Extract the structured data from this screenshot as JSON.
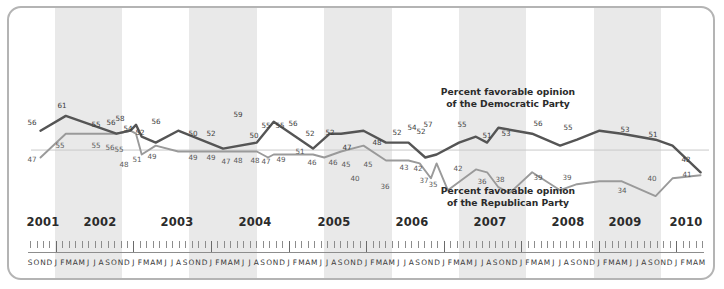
{
  "chart_data": {
    "type": "line",
    "title": "",
    "xlabel": "",
    "ylabel": "",
    "ylim": [
      30,
      65
    ],
    "grid": false,
    "legend_position": "inline-annotations",
    "annotations": [
      {
        "id": "dem",
        "text_line1": "Percent favorable opinion",
        "text_line2": "of the Democratic Party"
      },
      {
        "id": "rep",
        "text_line1": "Percent favorable opinion",
        "text_line2": "of the Republican Party"
      }
    ],
    "years": [
      "2001",
      "2002",
      "2003",
      "2004",
      "2005",
      "2006",
      "2007",
      "2008",
      "2009",
      "2010"
    ],
    "months_axis": [
      "S",
      "O",
      "N",
      "D",
      "J",
      "F",
      "M",
      "A",
      "M",
      "J",
      "J",
      "A",
      "S",
      "O",
      "N",
      "D",
      "J",
      "F",
      "M",
      "A",
      "M",
      "J",
      "J",
      "A",
      "S",
      "O",
      "N",
      "D",
      "J",
      "F",
      "M",
      "A",
      "M",
      "J",
      "J",
      "A",
      "S",
      "O",
      "N",
      "D",
      "J",
      "F",
      "M",
      "A",
      "M",
      "J",
      "J",
      "A",
      "S",
      "O",
      "N",
      "D",
      "J",
      "F",
      "M",
      "A",
      "M",
      "J",
      "J",
      "A",
      "S",
      "O",
      "N",
      "D",
      "J",
      "F",
      "M",
      "A",
      "M",
      "J",
      "J",
      "A",
      "S",
      "O",
      "N",
      "D",
      "J",
      "F",
      "M",
      "A",
      "M",
      "J",
      "J",
      "A",
      "S",
      "O",
      "N",
      "D",
      "J",
      "F",
      "M",
      "A",
      "M",
      "J",
      "J",
      "A",
      "S",
      "O",
      "N",
      "D",
      "J",
      "F",
      "M",
      "A",
      "M"
    ],
    "series": [
      {
        "name": "Percent favorable opinion of the Democratic Party",
        "color": "#555555",
        "points": [
          {
            "t": 0.5,
            "v": 56,
            "label": "56",
            "lx": 32,
            "ly": 118
          },
          {
            "t": 5.0,
            "v": 61,
            "label": "61",
            "lx": 62,
            "ly": 101
          },
          {
            "t": 14.0,
            "v": 55,
            "label": "55",
            "lx": 96,
            "ly": 120
          },
          {
            "t": 16.5,
            "v": 56,
            "label": "56",
            "lx": 111,
            "ly": 118
          },
          {
            "t": 17.5,
            "v": 58,
            "label": "58",
            "lx": 120,
            "ly": 114
          },
          {
            "t": 18.5,
            "v": 54,
            "label": "54",
            "lx": 128,
            "ly": 124
          },
          {
            "t": 21.0,
            "v": 52,
            "label": "52",
            "lx": 140,
            "ly": 128
          },
          {
            "t": 25.0,
            "v": 56,
            "label": "56",
            "lx": 156,
            "ly": 117
          },
          {
            "t": 33.0,
            "v": 50,
            "label": "50",
            "lx": 193,
            "ly": 129
          },
          {
            "t": 39.0,
            "v": 52,
            "label": "52",
            "lx": 211,
            "ly": 129
          },
          {
            "t": 42.0,
            "v": 59,
            "label": "59",
            "lx": 238,
            "ly": 110
          },
          {
            "t": 49.0,
            "v": 50,
            "label": "50",
            "lx": 254,
            "ly": 131
          },
          {
            "t": 52.0,
            "v": 55,
            "label": "55",
            "lx": 266,
            "ly": 121
          },
          {
            "t": 54.0,
            "v": 55,
            "label": "55",
            "lx": 280,
            "ly": 121
          },
          {
            "t": 58.0,
            "v": 56,
            "label": "56",
            "lx": 293,
            "ly": 119
          },
          {
            "t": 62.0,
            "v": 52,
            "label": "52",
            "lx": 310,
            "ly": 129
          },
          {
            "t": 66.0,
            "v": 52,
            "label": "52",
            "lx": 330,
            "ly": 128
          },
          {
            "t": 69.0,
            "v": 47,
            "label": "47",
            "lx": 347,
            "ly": 143
          },
          {
            "t": 71.0,
            "v": 48,
            "label": "48",
            "lx": 377,
            "ly": 138
          },
          {
            "t": 75.0,
            "v": 52,
            "label": "52",
            "lx": 397,
            "ly": 128
          },
          {
            "t": 78.0,
            "v": 54,
            "label": "54",
            "lx": 412,
            "ly": 123
          },
          {
            "t": 80.0,
            "v": 52,
            "label": "52",
            "lx": 421,
            "ly": 127
          },
          {
            "t": 82.0,
            "v": 57,
            "label": "57",
            "lx": 428,
            "ly": 120
          },
          {
            "t": 88.0,
            "v": 55,
            "label": "55",
            "lx": 462,
            "ly": 120
          },
          {
            "t": 93.0,
            "v": 51,
            "label": "51",
            "lx": 487,
            "ly": 131
          },
          {
            "t": 96.0,
            "v": 53,
            "label": "53",
            "lx": 506,
            "ly": 129
          },
          {
            "t": 100.0,
            "v": 56,
            "label": "56",
            "lx": 538,
            "ly": 119
          },
          {
            "t": 104.0,
            "v": 55,
            "label": "55",
            "lx": 568,
            "ly": 123
          },
          {
            "t": 110.0,
            "v": 53,
            "label": "53",
            "lx": 625,
            "ly": 125
          },
          {
            "t": 113.0,
            "v": 51,
            "label": "51",
            "lx": 653,
            "ly": 130
          },
          {
            "t": 118.0,
            "v": 42,
            "label": "42",
            "lx": 686,
            "ly": 155
          }
        ]
      },
      {
        "name": "Percent favorable opinion of the Republican Party",
        "color": "#9a9a9a",
        "points": [
          {
            "t": 0.5,
            "v": 47,
            "label": "47",
            "lx": 32,
            "ly": 155
          },
          {
            "t": 5.0,
            "v": 55,
            "label": "55",
            "lx": 60,
            "ly": 141
          },
          {
            "t": 14.0,
            "v": 55,
            "label": "55",
            "lx": 96,
            "ly": 141
          },
          {
            "t": 16.5,
            "v": 56,
            "label": "56",
            "lx": 110,
            "ly": 143
          },
          {
            "t": 17.5,
            "v": 55,
            "label": "55",
            "lx": 119,
            "ly": 145
          },
          {
            "t": 18.5,
            "v": 48,
            "label": "48",
            "lx": 124,
            "ly": 160
          },
          {
            "t": 21.0,
            "v": 51,
            "label": "51",
            "lx": 137,
            "ly": 155
          },
          {
            "t": 25.0,
            "v": 49,
            "label": "49",
            "lx": 152,
            "ly": 152
          },
          {
            "t": 33.0,
            "v": 49,
            "label": "49",
            "lx": 193,
            "ly": 153
          },
          {
            "t": 39.0,
            "v": 49,
            "label": "49",
            "lx": 211,
            "ly": 153
          },
          {
            "t": 41.0,
            "v": 47,
            "label": "47",
            "lx": 226,
            "ly": 157
          },
          {
            "t": 42.0,
            "v": 48,
            "label": "48",
            "lx": 238,
            "ly": 156
          },
          {
            "t": 49.0,
            "v": 48,
            "label": "48",
            "lx": 255,
            "ly": 156
          },
          {
            "t": 51.0,
            "v": 47,
            "label": "47",
            "lx": 266,
            "ly": 157
          },
          {
            "t": 54.0,
            "v": 49,
            "label": "49",
            "lx": 281,
            "ly": 155
          },
          {
            "t": 58.0,
            "v": 51,
            "label": "51",
            "lx": 300,
            "ly": 147
          },
          {
            "t": 62.0,
            "v": 46,
            "label": "46",
            "lx": 312,
            "ly": 158
          },
          {
            "t": 66.0,
            "v": 46,
            "label": "46",
            "lx": 333,
            "ly": 158
          },
          {
            "t": 68.0,
            "v": 45,
            "label": "45",
            "lx": 346,
            "ly": 160
          },
          {
            "t": 70.0,
            "v": 40,
            "label": "40",
            "lx": 355,
            "ly": 174
          },
          {
            "t": 71.0,
            "v": 45,
            "label": "45",
            "lx": 368,
            "ly": 160
          },
          {
            "t": 73.0,
            "v": 36,
            "label": "36",
            "lx": 385,
            "ly": 182
          },
          {
            "t": 78.0,
            "v": 43,
            "label": "43",
            "lx": 404,
            "ly": 163
          },
          {
            "t": 80.0,
            "v": 42,
            "label": "42",
            "lx": 418,
            "ly": 164
          },
          {
            "t": 82.0,
            "v": 37,
            "label": "37",
            "lx": 424,
            "ly": 176
          },
          {
            "t": 84.0,
            "v": 35,
            "label": "35",
            "lx": 433,
            "ly": 180
          },
          {
            "t": 88.0,
            "v": 42,
            "label": "42",
            "lx": 458,
            "ly": 164
          },
          {
            "t": 93.0,
            "v": 36,
            "label": "36",
            "lx": 482,
            "ly": 177
          },
          {
            "t": 96.0,
            "v": 38,
            "label": "38",
            "lx": 500,
            "ly": 175
          },
          {
            "t": 100.0,
            "v": 39,
            "label": "39",
            "lx": 538,
            "ly": 173
          },
          {
            "t": 104.0,
            "v": 39,
            "label": "39",
            "lx": 567,
            "ly": 173
          },
          {
            "t": 110.0,
            "v": 34,
            "label": "34",
            "lx": 622,
            "ly": 186
          },
          {
            "t": 113.0,
            "v": 40,
            "label": "40",
            "lx": 652,
            "ly": 174
          },
          {
            "t": 118.0,
            "v": 41,
            "label": "41",
            "lx": 687,
            "ly": 170
          }
        ]
      }
    ]
  },
  "years": [
    {
      "label": "2001",
      "x": 43
    },
    {
      "label": "2002",
      "x": 100
    },
    {
      "label": "2003",
      "x": 177
    },
    {
      "label": "2004",
      "x": 255
    },
    {
      "label": "2005",
      "x": 334
    },
    {
      "label": "2006",
      "x": 412
    },
    {
      "label": "2007",
      "x": 490
    },
    {
      "label": "2008",
      "x": 568
    },
    {
      "label": "2009",
      "x": 625
    },
    {
      "label": "2010",
      "x": 686
    }
  ],
  "annotations": {
    "dem": {
      "line1": "Percent favorable opinion",
      "line2": "of the Democratic Party"
    },
    "rep": {
      "line1": "Percent favorable opinion",
      "line2": "of the Republican Party"
    }
  },
  "colors": {
    "democratic_line": "#555555",
    "republican_line": "#9a9a9a",
    "band": "#e9e9e9",
    "frame_border": "#b4b4b4",
    "background": "#ffffff"
  }
}
